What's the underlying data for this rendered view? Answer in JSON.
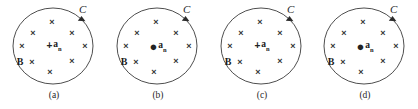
{
  "figure": {
    "name": "magnetic-field-loop-panels",
    "width": 418,
    "height": 109,
    "background_color": "#ffffff",
    "stroke_color": "#3a3a3a",
    "text_color": "#1f1f1f"
  },
  "common": {
    "loop_label": "C",
    "field_label": "B",
    "area_vector_base": "a",
    "area_vector_subscript": "n",
    "x_mark_glyph": "×",
    "into_page_glyph": "+",
    "out_of_page_glyph": "●",
    "x_mark_count": 9,
    "loop_direction": "clockwise",
    "arrow_position": "upper-right"
  },
  "x_positions": [
    {
      "x": 50,
      "y": 22
    },
    {
      "x": 31,
      "y": 31
    },
    {
      "x": 70,
      "y": 31
    },
    {
      "x": 20,
      "y": 46
    },
    {
      "x": 82,
      "y": 46
    },
    {
      "x": 29,
      "y": 62
    },
    {
      "x": 70,
      "y": 62
    },
    {
      "x": 47,
      "y": 72
    },
    {
      "x": 50,
      "y": 22
    }
  ],
  "panels": [
    {
      "id": "a",
      "caption": "(a)",
      "loop_label": "C",
      "field_label": "B",
      "center_symbol": "+",
      "center_symbol_name": "into-page-vector",
      "area_vector_base": "a",
      "area_vector_subscript": "n"
    },
    {
      "id": "b",
      "caption": "(b)",
      "loop_label": "C",
      "field_label": "B",
      "center_symbol": "●",
      "center_symbol_name": "out-of-page-vector",
      "area_vector_base": "a",
      "area_vector_subscript": "n"
    },
    {
      "id": "c",
      "caption": "(c)",
      "loop_label": "C",
      "field_label": "B",
      "center_symbol": "+",
      "center_symbol_name": "into-page-vector",
      "area_vector_base": "a",
      "area_vector_subscript": "n"
    },
    {
      "id": "d",
      "caption": "(d)",
      "loop_label": "C",
      "field_label": "B",
      "center_symbol": "●",
      "center_symbol_name": "out-of-page-vector",
      "area_vector_base": "a",
      "area_vector_subscript": "n"
    }
  ]
}
